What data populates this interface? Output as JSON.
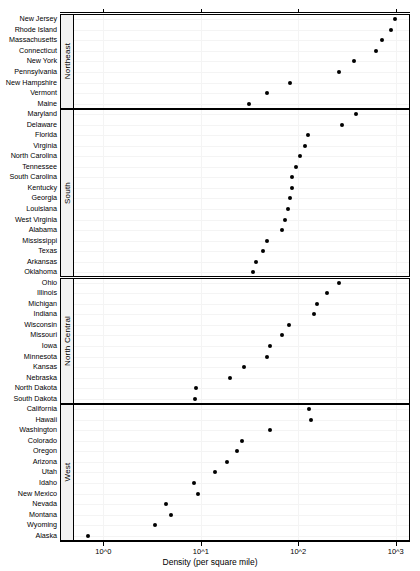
{
  "figure": {
    "title": "",
    "axis": {
      "xlabel": "Density (per square mile)",
      "xticks": [
        "10^0",
        "10^1",
        "10^2",
        "10^3"
      ]
    }
  },
  "chart_data": {
    "type": "scatter",
    "subtype": "cleveland-dot-plot",
    "title": "",
    "xlabel": "Density (per square mile)",
    "ylabel": "",
    "xscale": "log10",
    "xlim": [
      0.5,
      1400
    ],
    "xtick_values": [
      1,
      10,
      100,
      1000
    ],
    "xtick_labels": [
      "10^0",
      "10^1",
      "10^2",
      "10^3"
    ],
    "grid": true,
    "legend": "none",
    "panel_variable": "Region",
    "panels": [
      {
        "name": "Northeast",
        "categories": [
          "New Jersey",
          "Rhode Island",
          "Massachusetts",
          "Connecticut",
          "New York",
          "Pennsylvania",
          "New Hampshire",
          "Vermont",
          "Maine"
        ],
        "values": [
          975,
          904,
          727,
          624,
          371,
          262,
          81.8,
          47.8,
          31.3
        ]
      },
      {
        "name": "South",
        "categories": [
          "Maryland",
          "Delaware",
          "Florida",
          "Virginia",
          "North Carolina",
          "Tennessee",
          "South Carolina",
          "Kentucky",
          "Georgia",
          "Louisiana",
          "West Virginia",
          "Alabama",
          "Mississippi",
          "Texas",
          "Arkansas",
          "Oklahoma"
        ],
        "values": [
          393,
          284,
          126,
          116,
          105,
          94.8,
          85.8,
          85.4,
          82.5,
          77.6,
          72.5,
          68.4,
          47.3,
          43.1,
          37.2,
          34.7
        ]
      },
      {
        "name": "North Central",
        "categories": [
          "Ohio",
          "Illinois",
          "Michigan",
          "Indiana",
          "Wisconsin",
          "Missouri",
          "Iowa",
          "Minnesota",
          "Kansas",
          "Nebraska",
          "North Dakota",
          "South Dakota"
        ],
        "values": [
          260,
          199,
          157,
          144,
          80.6,
          68.8,
          50.8,
          47.7,
          27.6,
          19.9,
          8.9,
          8.8
        ]
      },
      {
        "name": "West",
        "categories": [
          "California",
          "Hawaii",
          "Washington",
          "Colorado",
          "Oregon",
          "Arizona",
          "Utah",
          "Idaho",
          "New Mexico",
          "Nevada",
          "Montana",
          "Wyoming",
          "Alaska"
        ],
        "values": [
          128,
          134,
          51.2,
          26.3,
          23.5,
          18.4,
          14.0,
          8.6,
          9.3,
          4.4,
          4.9,
          3.4,
          0.7
        ]
      }
    ]
  },
  "colors": {
    "dot": "#000000",
    "panel_border": "#000000",
    "strip_background": "#f2f2f2",
    "grid": "#f4f4f4",
    "background": "#ffffff"
  }
}
